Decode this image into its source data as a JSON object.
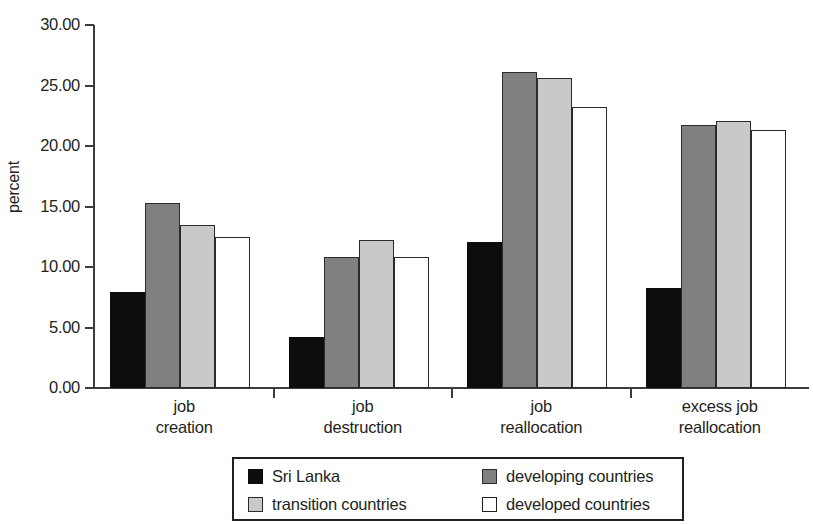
{
  "chart_data": {
    "type": "bar",
    "title": "",
    "xlabel": "",
    "ylabel": "percent",
    "ylim": [
      0,
      30
    ],
    "ytick_step": 5,
    "ytick_labels": [
      "30.00",
      "25.00",
      "20.00",
      "15.00",
      "10.00",
      "5.00",
      "0.00"
    ],
    "ytick_values": [
      30,
      25,
      20,
      15,
      10,
      5,
      0
    ],
    "grid": false,
    "legend_position": "bottom",
    "categories": [
      "job creation",
      "job destruction",
      "job reallocation",
      "excess job reallocation"
    ],
    "category_lines": [
      [
        "job",
        "creation"
      ],
      [
        "job",
        "destruction"
      ],
      [
        "job",
        "reallocation"
      ],
      [
        "excess job",
        "reallocation"
      ]
    ],
    "series": [
      {
        "name": "Sri Lanka",
        "color": "#0d0d0d",
        "values": [
          7.9,
          4.2,
          12.1,
          8.3
        ]
      },
      {
        "name": "developing countries",
        "color": "#808080",
        "values": [
          15.3,
          10.8,
          26.1,
          21.7
        ]
      },
      {
        "name": "transition countries",
        "color": "#c9c9c9",
        "values": [
          13.5,
          12.2,
          25.6,
          22.1
        ]
      },
      {
        "name": "developed countries",
        "color": "#ffffff",
        "values": [
          12.5,
          10.8,
          23.2,
          21.3
        ]
      }
    ]
  },
  "axis": {
    "y_title": "percent"
  }
}
